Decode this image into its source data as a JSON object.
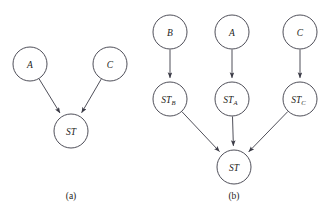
{
  "figure": {
    "background_color": "#ffffff",
    "stroke_color": "#3b3b46",
    "text_color": "#1d1d22",
    "panels": [
      {
        "id": "a",
        "caption": "(a)",
        "caption_x": 71,
        "caption_y": 196,
        "nodes": [
          {
            "id": "a-A",
            "label": "A",
            "sub": "",
            "cx": 30,
            "cy": 64,
            "r": 17
          },
          {
            "id": "a-C",
            "label": "C",
            "sub": "",
            "cx": 110,
            "cy": 64,
            "r": 17
          },
          {
            "id": "a-ST",
            "label": "ST",
            "sub": "",
            "cx": 71,
            "cy": 131,
            "r": 17
          }
        ],
        "edges": [
          {
            "id": "a-edge-A-ST",
            "from": "a-A",
            "to": "a-ST",
            "label": "A to ST"
          },
          {
            "id": "a-edge-C-ST",
            "from": "a-C",
            "to": "a-ST",
            "label": "C to ST"
          }
        ]
      },
      {
        "id": "b",
        "caption": "(b)",
        "caption_x": 234,
        "caption_y": 196,
        "nodes": [
          {
            "id": "b-B",
            "label": "B",
            "sub": "",
            "cx": 170,
            "cy": 32,
            "r": 17
          },
          {
            "id": "b-A",
            "label": "A",
            "sub": "",
            "cx": 232,
            "cy": 32,
            "r": 17
          },
          {
            "id": "b-C",
            "label": "C",
            "sub": "",
            "cx": 300,
            "cy": 32,
            "r": 17
          },
          {
            "id": "b-STB",
            "label": "ST",
            "sub": "B",
            "cx": 170,
            "cy": 99,
            "r": 17
          },
          {
            "id": "b-STA",
            "label": "ST",
            "sub": "A",
            "cx": 232,
            "cy": 99,
            "r": 17
          },
          {
            "id": "b-STC",
            "label": "ST",
            "sub": "C",
            "cx": 300,
            "cy": 99,
            "r": 17
          },
          {
            "id": "b-ST",
            "label": "ST",
            "sub": "",
            "cx": 234,
            "cy": 167,
            "r": 17
          }
        ],
        "edges": [
          {
            "id": "b-edge-B-STB",
            "from": "b-B",
            "to": "b-STB",
            "label": "B to ST_B"
          },
          {
            "id": "b-edge-A-STA",
            "from": "b-A",
            "to": "b-STA",
            "label": "A to ST_A"
          },
          {
            "id": "b-edge-C-STC",
            "from": "b-C",
            "to": "b-STC",
            "label": "C to ST_C"
          },
          {
            "id": "b-edge-STB-ST",
            "from": "b-STB",
            "to": "b-ST",
            "label": "ST_B to ST"
          },
          {
            "id": "b-edge-STA-ST",
            "from": "b-STA",
            "to": "b-ST",
            "label": "ST_A to ST"
          },
          {
            "id": "b-edge-STC-ST",
            "from": "b-STC",
            "to": "b-ST",
            "label": "ST_C to ST"
          }
        ]
      }
    ]
  }
}
